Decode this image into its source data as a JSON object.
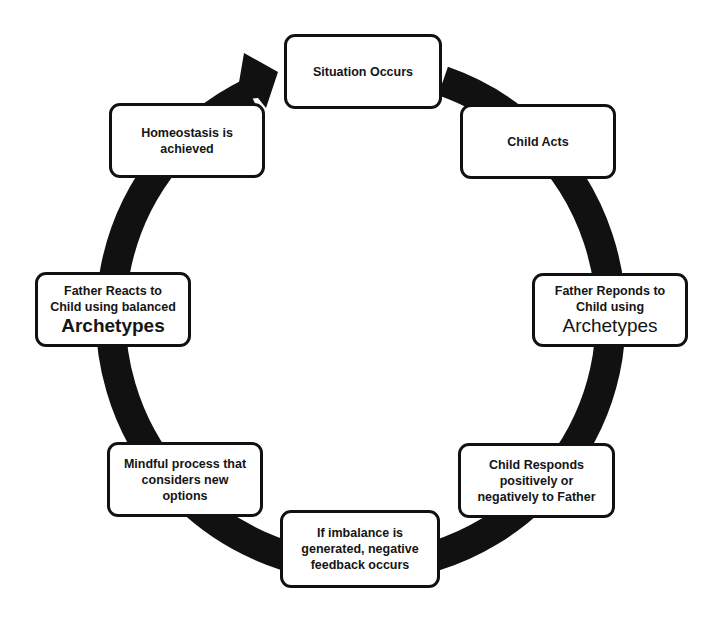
{
  "diagram": {
    "type": "cycle",
    "direction": "clockwise",
    "ring_color": "#111111",
    "box_border_color": "#111111",
    "steps": [
      {
        "id": "situation",
        "lines": [
          "Situation Occurs"
        ]
      },
      {
        "id": "child-acts",
        "lines": [
          "Child Acts"
        ]
      },
      {
        "id": "father-responds",
        "lines": [
          "Father Reponds to",
          "Child using"
        ],
        "emphasis": "Archetypes"
      },
      {
        "id": "child-responds",
        "lines": [
          "Child Responds",
          "positively or",
          "negatively to Father"
        ]
      },
      {
        "id": "imbalance",
        "lines": [
          "If imbalance is",
          "generated, negative",
          "feedback occurs"
        ]
      },
      {
        "id": "mindful",
        "lines": [
          "Mindful process that",
          "considers new",
          "options"
        ]
      },
      {
        "id": "father-reacts",
        "lines": [
          "Father Reacts to",
          "Child using balanced"
        ],
        "emphasis": "Archetypes"
      },
      {
        "id": "homeostasis",
        "lines": [
          "Homeostasis is",
          "achieved"
        ]
      }
    ]
  }
}
